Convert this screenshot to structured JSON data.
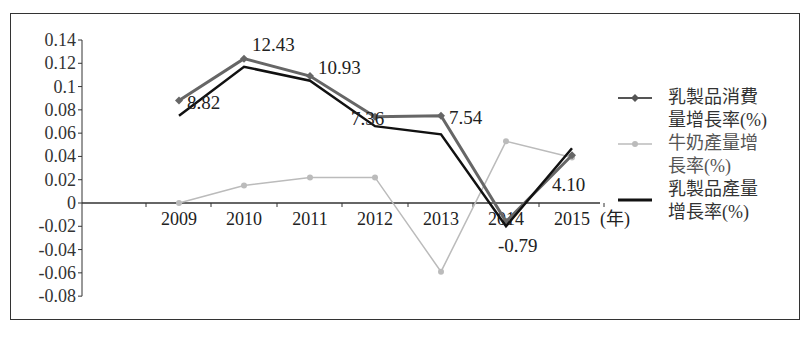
{
  "chart_data": {
    "type": "line",
    "title": "",
    "xlabel": "(年)",
    "ylabel": "",
    "ylim": [
      -0.08,
      0.14
    ],
    "yticks": [
      "0.14",
      "0.12",
      "0.1",
      "0.08",
      "0.06",
      "0.04",
      "0.02",
      "0",
      "-0.02",
      "-0.04",
      "-0.06",
      "-0.08"
    ],
    "categories": [
      "2009",
      "2010",
      "2011",
      "2012",
      "2013",
      "2014",
      "2015"
    ],
    "x_unit_label": "(年)",
    "series": [
      {
        "name": "乳製品消費量增長率(%)",
        "color": "#666666",
        "marker": "diamond",
        "values": [
          0.088,
          0.124,
          0.109,
          0.074,
          0.075,
          -0.016,
          0.041
        ],
        "labels": [
          "8.82",
          "12.43",
          "10.93",
          "7.36",
          "7.54",
          "-0.79",
          "4.10"
        ]
      },
      {
        "name": "牛奶產量增長率(%)",
        "color": "#bbbbbb",
        "marker": "circle",
        "values": [
          0.0,
          0.015,
          0.022,
          0.022,
          -0.059,
          0.053,
          0.039
        ]
      },
      {
        "name": "乳製品產量增長率(%)",
        "color": "#111111",
        "marker": "none",
        "values": [
          0.075,
          0.117,
          0.105,
          0.066,
          0.059,
          -0.02,
          0.047
        ]
      }
    ],
    "grid": false,
    "legend_position": "right"
  },
  "legend": {
    "items": [
      {
        "line1": "乳製品消費",
        "line2": "量增長率(%)"
      },
      {
        "line1": "牛奶產量增",
        "line2": "長率(%)"
      },
      {
        "line1": "乳製品產量",
        "line2": "增長率(%)"
      }
    ]
  }
}
